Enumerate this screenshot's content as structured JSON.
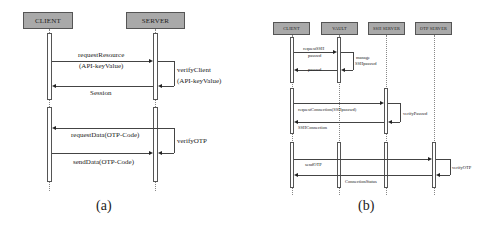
{
  "diagram_a": {
    "caption": "(a)",
    "participants": [
      "CLIENT",
      "SERVER"
    ],
    "messages": [
      {
        "label_line1": "requestResource",
        "label_line2": "(API-keyValue)",
        "from": "CLIENT",
        "to": "SERVER"
      },
      {
        "label_line1": "verifyClient",
        "label_line2": "(API-keyValue)",
        "from": "SERVER",
        "to": "SERVER",
        "self": true
      },
      {
        "label": "Session",
        "from": "SERVER",
        "to": "CLIENT"
      },
      {
        "label": "requestData(OTP-Code)",
        "from": "SERVER",
        "to": "CLIENT"
      },
      {
        "label": "sendData(OTP-Code)",
        "from": "CLIENT",
        "to": "SERVER"
      },
      {
        "label": "verifyOTP",
        "from": "SERVER",
        "to": "SERVER",
        "self": true
      }
    ]
  },
  "diagram_b": {
    "caption": "(b)",
    "participants": [
      "CLIENT",
      "VAULT",
      "SSH SERVER",
      "OTP SERVER"
    ],
    "messages": [
      {
        "label_line1": "requestSSH",
        "label_line2": "passwd",
        "from": "CLIENT",
        "to": "VAULT"
      },
      {
        "label_line1": "manage",
        "label_line2": "SSHpasswd",
        "from": "VAULT",
        "to": "VAULT",
        "self": true
      },
      {
        "label": "passwd",
        "from": "VAULT",
        "to": "CLIENT"
      },
      {
        "label": "requestConnection(SSHpasswd)",
        "from": "CLIENT",
        "to": "SSH SERVER"
      },
      {
        "label": "verifyPasswd",
        "from": "SSH SERVER",
        "to": "SSH SERVER",
        "self": true
      },
      {
        "label": "SSHConnection",
        "from": "SSH SERVER",
        "to": "CLIENT"
      },
      {
        "label": "sendOTP",
        "from": "CLIENT",
        "to": "OTP SERVER"
      },
      {
        "label": "verifyOTP",
        "from": "OTP SERVER",
        "to": "OTP SERVER",
        "self": true
      },
      {
        "label": "ConnectionStatus",
        "from": "OTP SERVER",
        "to": "CLIENT"
      }
    ]
  }
}
